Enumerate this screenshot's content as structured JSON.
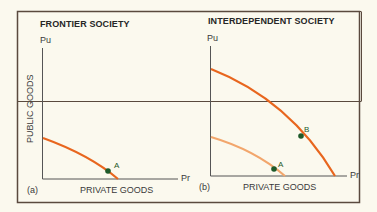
{
  "figure": {
    "panel_a": {
      "title": "FRONTIER SOCIETY",
      "y_axis_end_label": "Pu",
      "x_axis_end_label": "Pr",
      "y_axis_title": "PUBLIC GOODS",
      "x_axis_title": "PRIVATE GOODS",
      "panel_label": "(a)",
      "points": [
        {
          "label": "A"
        }
      ]
    },
    "panel_b": {
      "title": "INTERDEPENDENT SOCIETY",
      "y_axis_end_label": "Pu",
      "x_axis_end_label": "Pr",
      "x_axis_title": "PRIVATE GOODS",
      "panel_label": "(b)",
      "points": [
        {
          "label": "A"
        },
        {
          "label": "B"
        }
      ]
    }
  },
  "colors": {
    "curve_dark": "#e8661e",
    "curve_light": "#f2a66c",
    "point": "#1e5a2a",
    "axis": "#555555",
    "frame": "#5a4a3e",
    "background": "#fbf9ee"
  }
}
